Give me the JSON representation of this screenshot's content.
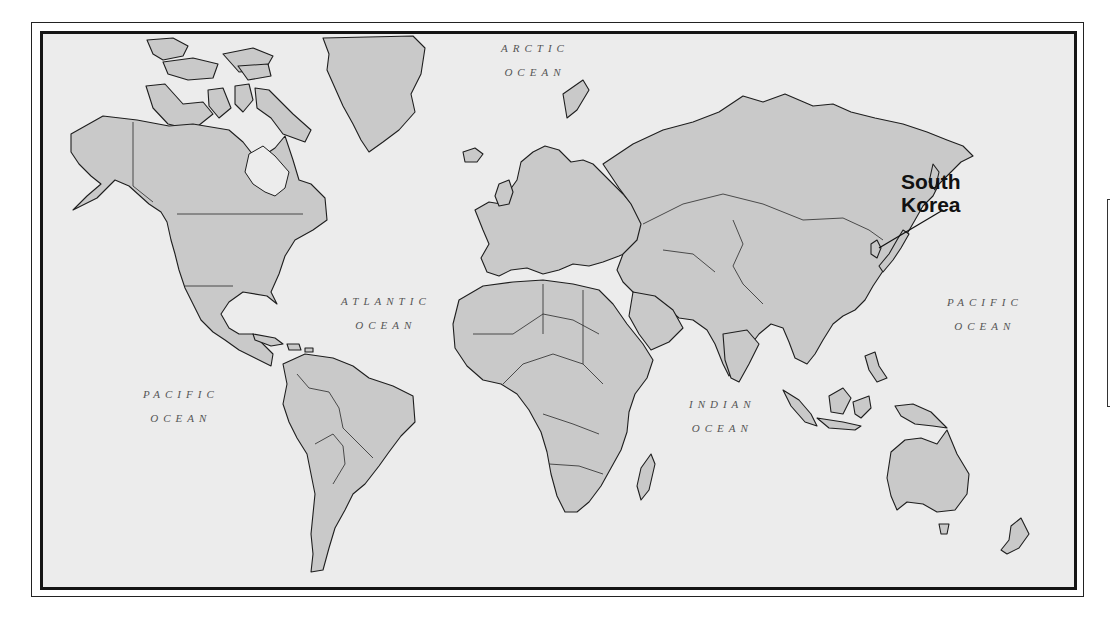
{
  "map": {
    "type": "world-political-outline",
    "colors": {
      "land": "#c9c9c9",
      "ocean": "#ececec",
      "outline": "#1e1e1e",
      "frame": "#151515",
      "label_text": "#555555",
      "callout_text": "#111111"
    },
    "oceans": [
      {
        "id": "arctic",
        "line1": "ARCTIC",
        "line2": "OCEAN"
      },
      {
        "id": "atlantic",
        "line1": "ATLANTIC",
        "line2": "OCEAN"
      },
      {
        "id": "pacific-west",
        "line1": "PACIFIC",
        "line2": "OCEAN"
      },
      {
        "id": "pacific-east",
        "line1": "PACIFIC",
        "line2": "OCEAN"
      },
      {
        "id": "indian",
        "line1": "INDIAN",
        "line2": "OCEAN"
      }
    ],
    "callout": {
      "country": "South Korea",
      "line1": "South",
      "line2": "Korea"
    }
  }
}
